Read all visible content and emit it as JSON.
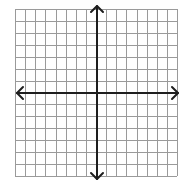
{
  "diagram": {
    "type": "coordinate-plane",
    "grid": {
      "columns": 16,
      "rows": 14,
      "left": 15,
      "top": 9,
      "right": 177,
      "bottom": 176,
      "line_color": "#9a9a9a",
      "line_width": 1
    },
    "axes": {
      "x_axis_y": 93,
      "y_axis_x": 97,
      "color": "#1e1e1e",
      "width": 2,
      "x_arrow_left": 17,
      "x_arrow_right": 178,
      "y_arrow_top": 6,
      "y_arrow_bottom": 179,
      "arrow_size": 6
    },
    "background": "#ffffff"
  }
}
